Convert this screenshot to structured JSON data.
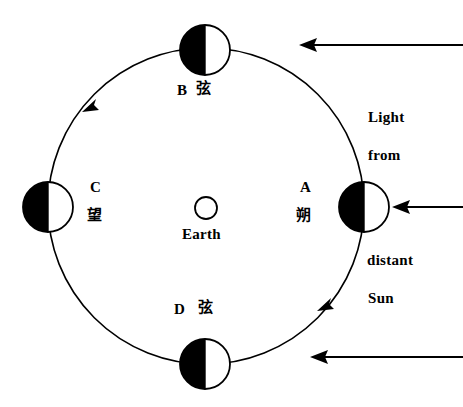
{
  "diagram": {
    "earth": {
      "label": "Earth",
      "cx": 206,
      "cy": 208,
      "r": 11
    },
    "orbit": {
      "cx": 206,
      "cy": 206,
      "r": 158,
      "direction": "counterclockwise",
      "stroke": "#000000"
    },
    "moons": [
      {
        "id": "A",
        "letter": "A",
        "cjk": "朔",
        "phase_name": "new-moon",
        "lit_side": "right",
        "cx": 364,
        "cy": 207,
        "r": 25,
        "label_position": "left"
      },
      {
        "id": "B",
        "letter": "B",
        "cjk": "弦",
        "phase_name": "quarter-moon",
        "lit_side": "right",
        "cx": 205,
        "cy": 50,
        "r": 25,
        "label_position": "below"
      },
      {
        "id": "C",
        "letter": "C",
        "cjk": "望",
        "phase_name": "full-moon",
        "lit_side": "right",
        "cx": 48,
        "cy": 207,
        "r": 25,
        "label_position": "right"
      },
      {
        "id": "D",
        "letter": "D",
        "cjk": "弦",
        "phase_name": "quarter-moon",
        "lit_side": "right",
        "cx": 205,
        "cy": 364,
        "r": 25,
        "label_position": "above"
      }
    ],
    "sunlight": {
      "lines": [
        "Light",
        "from",
        "distant",
        "Sun"
      ],
      "ray_direction": "right-to-left",
      "rays": [
        {
          "x1": 463,
          "y1": 45,
          "x2": 300,
          "y2": 45
        },
        {
          "x1": 463,
          "y1": 207,
          "x2": 392,
          "y2": 207
        },
        {
          "x1": 463,
          "y1": 357,
          "x2": 310,
          "y2": 357
        }
      ]
    },
    "colors": {
      "background": "#ffffff",
      "ink": "#000000",
      "dark_side": "#000000",
      "lit_side": "#ffffff"
    }
  }
}
